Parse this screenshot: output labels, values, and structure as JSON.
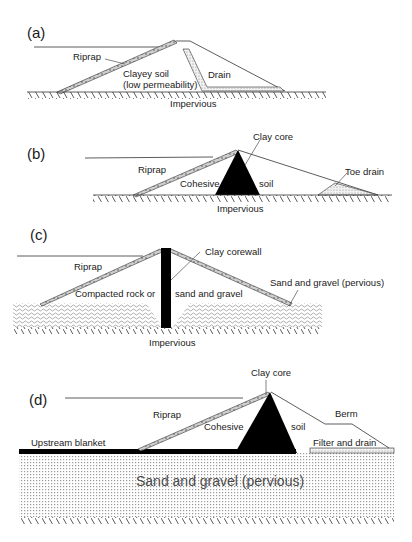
{
  "figure": {
    "panels": [
      {
        "id": "a",
        "label": "(a)",
        "labels": {
          "riprap": "Riprap",
          "material_line1": "Clayey soil",
          "material_line2": "(low permeability)",
          "drain": "Drain",
          "foundation": "Impervious"
        }
      },
      {
        "id": "b",
        "label": "(b)",
        "labels": {
          "core": "Clay core",
          "riprap": "Riprap",
          "material_left": "Cohesive",
          "material_right": "soil",
          "toe_drain": "Toe drain",
          "foundation": "Impervious"
        }
      },
      {
        "id": "c",
        "label": "(c)",
        "labels": {
          "corewall": "Clay corewall",
          "riprap": "Riprap",
          "material_left": "Compacted rock or",
          "material_right": "sand and gravel",
          "foundation_layer": "Sand and gravel (pervious)",
          "foundation": "Impervious"
        }
      },
      {
        "id": "d",
        "label": "(d)",
        "labels": {
          "core": "Clay core",
          "riprap": "Riprap",
          "berm": "Berm",
          "material_left": "Cohesive",
          "material_right": "soil",
          "blanket": "Upstream blanket",
          "filter": "Filter and drain",
          "foundation_layer": "Sand and gravel (pervious)"
        }
      }
    ],
    "colors": {
      "line": "#2a2a2a",
      "core": "#000000",
      "drain_fill": "#d8d8d8",
      "background": "#ffffff"
    }
  }
}
